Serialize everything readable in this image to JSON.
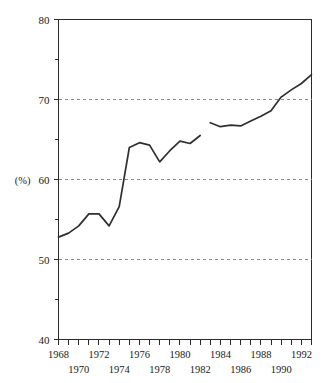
{
  "chart_data": {
    "type": "line",
    "title": "",
    "subtitle": "",
    "xlabel": "",
    "ylabel": "",
    "unit_label": "(%)",
    "grid": true,
    "grid_values": [
      50,
      60,
      70
    ],
    "legend": [],
    "legend_position": "none",
    "xlim": [
      1968,
      1993
    ],
    "ylim": [
      40,
      80
    ],
    "y_ticks_major": [
      40,
      50,
      60,
      70,
      80
    ],
    "y_tick_labels": [
      "40",
      "50",
      "60",
      "70",
      "80"
    ],
    "y_ticks_minor": [
      45,
      55,
      65,
      75
    ],
    "x_ticks": [
      1968,
      1969,
      1970,
      1971,
      1972,
      1973,
      1974,
      1975,
      1976,
      1977,
      1978,
      1979,
      1980,
      1981,
      1982,
      1983,
      1984,
      1985,
      1986,
      1987,
      1988,
      1989,
      1990,
      1991,
      1992,
      1993
    ],
    "x_tick_labels_top": [
      {
        "year": 1968,
        "label": "1968"
      },
      {
        "year": 1972,
        "label": "1972"
      },
      {
        "year": 1976,
        "label": "1976"
      },
      {
        "year": 1980,
        "label": "1980"
      },
      {
        "year": 1984,
        "label": "1984"
      },
      {
        "year": 1988,
        "label": "1988"
      },
      {
        "year": 1992,
        "label": "1992"
      }
    ],
    "x_tick_labels_bottom": [
      {
        "year": 1970,
        "label": "1970"
      },
      {
        "year": 1974,
        "label": "1974"
      },
      {
        "year": 1978,
        "label": "1978"
      },
      {
        "year": 1982,
        "label": "1982"
      },
      {
        "year": 1986,
        "label": "1986"
      },
      {
        "year": 1990,
        "label": "1990"
      }
    ],
    "series": [
      {
        "name": "segment-1",
        "x": [
          1968,
          1969,
          1970,
          1971,
          1972,
          1973,
          1974,
          1975,
          1976,
          1977,
          1978,
          1979,
          1980,
          1981,
          1982
        ],
        "values": [
          52.8,
          53.3,
          54.2,
          55.7,
          55.7,
          54.2,
          56.6,
          64.0,
          64.6,
          64.3,
          62.2,
          63.6,
          64.8,
          64.5,
          65.5
        ]
      },
      {
        "name": "segment-2",
        "x": [
          1983,
          1984,
          1985,
          1986,
          1987,
          1988,
          1989,
          1990,
          1991,
          1992,
          1993
        ],
        "values": [
          67.1,
          66.6,
          66.8,
          66.7,
          67.3,
          67.9,
          68.6,
          70.3,
          71.2,
          72.0,
          73.1
        ]
      }
    ]
  },
  "colors": {
    "line": "#2f2f2f",
    "grid": "#8a8a8a",
    "axis": "#2b2b2b",
    "background": "#ffffff"
  }
}
